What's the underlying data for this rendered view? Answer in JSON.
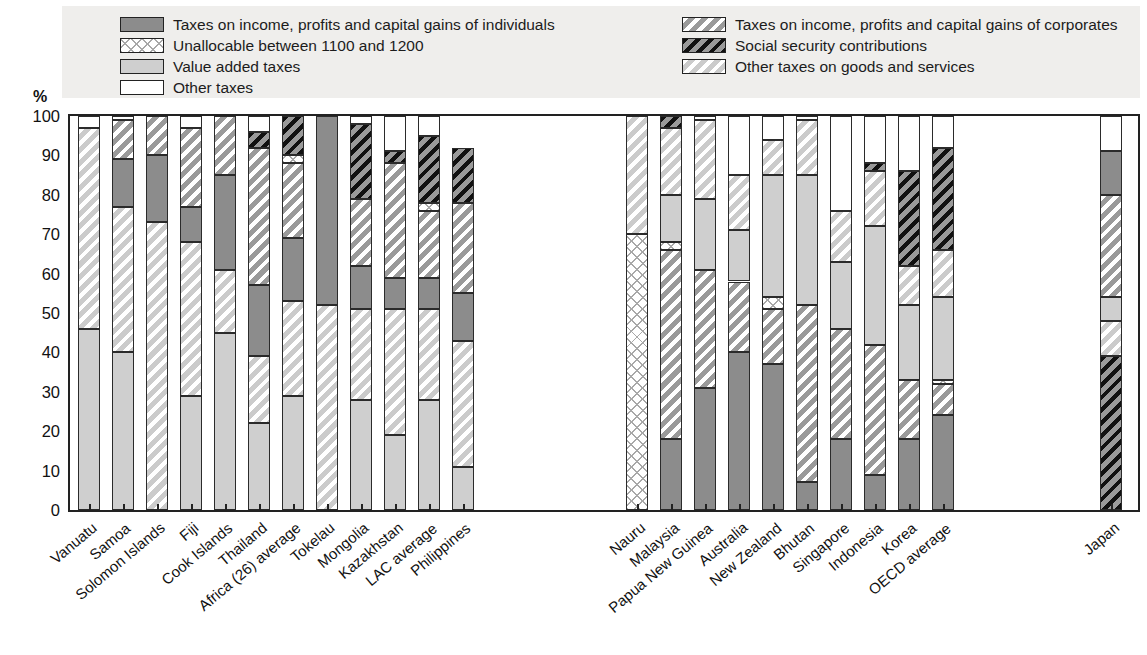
{
  "axis": {
    "y_unit": "%",
    "y_ticks": [
      0,
      10,
      20,
      30,
      40,
      50,
      60,
      70,
      80,
      90,
      100
    ],
    "y_label_0": "0",
    "y_label_10": "10",
    "y_label_20": "20",
    "y_label_30": "30",
    "y_label_40": "40",
    "y_label_50": "50",
    "y_label_60": "60",
    "y_label_70": "70",
    "y_label_80": "80",
    "y_label_90": "90",
    "y_label_100": "100"
  },
  "legend": {
    "left": [
      {
        "label": "Taxes on income, profits and capital gains of individuals",
        "key": "individuals",
        "fill": "f-ind"
      },
      {
        "label": "Unallocable between 1100 and 1200",
        "key": "unallocable",
        "fill": "f-unalloc"
      },
      {
        "label": "Value added taxes",
        "key": "vat",
        "fill": "f-vat"
      },
      {
        "label": "Other taxes",
        "key": "other",
        "fill": "f-other"
      }
    ],
    "right": [
      {
        "label": "Taxes on income, profits and capital gains of corporates",
        "key": "corporates",
        "fill": "f-corp"
      },
      {
        "label": "Social security contributions",
        "key": "social_security",
        "fill": "f-ssc"
      },
      {
        "label": "Other taxes on goods and services",
        "key": "other_goods_services",
        "fill": "f-othgs"
      }
    ]
  },
  "chart_data": {
    "type": "bar",
    "subtype": "stacked-100-percent",
    "title": "",
    "xlabel": "",
    "ylabel": "%",
    "ylim": [
      0,
      100
    ],
    "grid": false,
    "legend_position": "top",
    "series_order": [
      "vat",
      "other_goods_services",
      "unallocable",
      "individuals",
      "corporates",
      "social_security",
      "other"
    ],
    "series_names": {
      "individuals": "Taxes on income, profits and capital gains of individuals",
      "corporates": "Taxes on income, profits and capital gains of corporates",
      "unallocable": "Unallocable between 1100 and 1200",
      "social_security": "Social security contributions",
      "vat": "Value added taxes",
      "other_goods_services": "Other taxes on goods and services",
      "other": "Other taxes"
    },
    "categories": [
      "Vanuatu",
      "Samoa",
      "Solomon Islands",
      "Fiji",
      "Cook Islands",
      "Thailand",
      "Africa (26) average",
      "Tokelau",
      "Mongolia",
      "Kazakhstan",
      "LAC average",
      "Philippines",
      "",
      "Nauru",
      "Malaysia",
      "Papua New Guinea",
      "Australia",
      "New Zealand",
      "Bhutan",
      "Singapore",
      "Indonesia",
      "Korea",
      "OECD average",
      "",
      "Japan"
    ],
    "bars": [
      {
        "category": "Vanuatu",
        "segments": [
          {
            "key": "vat",
            "from": 0,
            "to": 46
          },
          {
            "key": "other_goods_services",
            "from": 46,
            "to": 97
          },
          {
            "key": "other",
            "from": 97,
            "to": 100
          }
        ]
      },
      {
        "category": "Samoa",
        "segments": [
          {
            "key": "vat",
            "from": 0,
            "to": 40
          },
          {
            "key": "other_goods_services",
            "from": 40,
            "to": 77
          },
          {
            "key": "individuals",
            "from": 77,
            "to": 89
          },
          {
            "key": "corporates",
            "from": 89,
            "to": 99
          },
          {
            "key": "other",
            "from": 99,
            "to": 100
          }
        ]
      },
      {
        "category": "Solomon Islands",
        "segments": [
          {
            "key": "other_goods_services",
            "from": 0,
            "to": 73
          },
          {
            "key": "individuals",
            "from": 73,
            "to": 90
          },
          {
            "key": "corporates",
            "from": 90,
            "to": 100
          }
        ]
      },
      {
        "category": "Fiji",
        "segments": [
          {
            "key": "vat",
            "from": 0,
            "to": 29
          },
          {
            "key": "other_goods_services",
            "from": 29,
            "to": 68
          },
          {
            "key": "individuals",
            "from": 68,
            "to": 77
          },
          {
            "key": "corporates",
            "from": 77,
            "to": 97
          },
          {
            "key": "other",
            "from": 97,
            "to": 100
          }
        ]
      },
      {
        "category": "Cook Islands",
        "segments": [
          {
            "key": "vat",
            "from": 0,
            "to": 45
          },
          {
            "key": "other_goods_services",
            "from": 45,
            "to": 61
          },
          {
            "key": "individuals",
            "from": 61,
            "to": 85
          },
          {
            "key": "corporates",
            "from": 85,
            "to": 100
          }
        ]
      },
      {
        "category": "Thailand",
        "segments": [
          {
            "key": "vat",
            "from": 0,
            "to": 22
          },
          {
            "key": "other_goods_services",
            "from": 22,
            "to": 39
          },
          {
            "key": "individuals",
            "from": 39,
            "to": 57
          },
          {
            "key": "corporates",
            "from": 57,
            "to": 92
          },
          {
            "key": "social_security",
            "from": 92,
            "to": 96
          },
          {
            "key": "other",
            "from": 96,
            "to": 100
          }
        ]
      },
      {
        "category": "Africa (26) average",
        "segments": [
          {
            "key": "vat",
            "from": 0,
            "to": 29
          },
          {
            "key": "other_goods_services",
            "from": 29,
            "to": 53
          },
          {
            "key": "individuals",
            "from": 53,
            "to": 69
          },
          {
            "key": "corporates",
            "from": 69,
            "to": 88
          },
          {
            "key": "unallocable",
            "from": 88,
            "to": 90
          },
          {
            "key": "social_security",
            "from": 90,
            "to": 100
          }
        ]
      },
      {
        "category": "Tokelau",
        "segments": [
          {
            "key": "other_goods_services",
            "from": 0,
            "to": 52
          },
          {
            "key": "individuals",
            "from": 52,
            "to": 100
          }
        ]
      },
      {
        "category": "Mongolia",
        "segments": [
          {
            "key": "vat",
            "from": 0,
            "to": 28
          },
          {
            "key": "other_goods_services",
            "from": 28,
            "to": 51
          },
          {
            "key": "individuals",
            "from": 51,
            "to": 62
          },
          {
            "key": "corporates",
            "from": 62,
            "to": 79
          },
          {
            "key": "social_security",
            "from": 79,
            "to": 98
          },
          {
            "key": "other",
            "from": 98,
            "to": 100
          }
        ]
      },
      {
        "category": "Kazakhstan",
        "segments": [
          {
            "key": "vat",
            "from": 0,
            "to": 19
          },
          {
            "key": "other_goods_services",
            "from": 19,
            "to": 51
          },
          {
            "key": "individuals",
            "from": 51,
            "to": 59
          },
          {
            "key": "corporates",
            "from": 59,
            "to": 88
          },
          {
            "key": "social_security",
            "from": 88,
            "to": 91
          },
          {
            "key": "other",
            "from": 91,
            "to": 100
          }
        ]
      },
      {
        "category": "LAC average",
        "segments": [
          {
            "key": "vat",
            "from": 0,
            "to": 28
          },
          {
            "key": "other_goods_services",
            "from": 28,
            "to": 51
          },
          {
            "key": "individuals",
            "from": 51,
            "to": 59
          },
          {
            "key": "corporates",
            "from": 59,
            "to": 76
          },
          {
            "key": "unallocable",
            "from": 76,
            "to": 78
          },
          {
            "key": "social_security",
            "from": 78,
            "to": 95
          },
          {
            "key": "other",
            "from": 95,
            "to": 100
          }
        ]
      },
      {
        "category": "Philippines",
        "segments": [
          {
            "key": "vat",
            "from": 0,
            "to": 11
          },
          {
            "key": "other_goods_services",
            "from": 11,
            "to": 43
          },
          {
            "key": "individuals",
            "from": 43,
            "to": 55
          },
          {
            "key": "corporates",
            "from": 55,
            "to": 78
          },
          {
            "key": "social_security",
            "from": 78,
            "to": 92
          }
        ]
      },
      {
        "category": "Nauru",
        "segments": [
          {
            "key": "unallocable",
            "from": 0,
            "to": 70
          },
          {
            "key": "other_goods_services",
            "from": 70,
            "to": 100
          }
        ]
      },
      {
        "category": "Malaysia",
        "segments": [
          {
            "key": "individuals",
            "from": 0,
            "to": 18
          },
          {
            "key": "corporates",
            "from": 18,
            "to": 66
          },
          {
            "key": "unallocable",
            "from": 66,
            "to": 68
          },
          {
            "key": "vat",
            "from": 68,
            "to": 80
          },
          {
            "key": "other_goods_services",
            "from": 80,
            "to": 97
          },
          {
            "key": "social_security",
            "from": 97,
            "to": 100
          }
        ]
      },
      {
        "category": "Papua New Guinea",
        "segments": [
          {
            "key": "individuals",
            "from": 0,
            "to": 31
          },
          {
            "key": "corporates",
            "from": 31,
            "to": 61
          },
          {
            "key": "vat",
            "from": 61,
            "to": 79
          },
          {
            "key": "other_goods_services",
            "from": 79,
            "to": 99
          },
          {
            "key": "other",
            "from": 99,
            "to": 100
          }
        ]
      },
      {
        "category": "Australia",
        "segments": [
          {
            "key": "individuals",
            "from": 0,
            "to": 40
          },
          {
            "key": "corporates",
            "from": 40,
            "to": 58
          },
          {
            "key": "vat",
            "from": 58,
            "to": 71
          },
          {
            "key": "other_goods_services",
            "from": 71,
            "to": 85
          },
          {
            "key": "other",
            "from": 85,
            "to": 100
          }
        ]
      },
      {
        "category": "New Zealand",
        "segments": [
          {
            "key": "individuals",
            "from": 0,
            "to": 37
          },
          {
            "key": "corporates",
            "from": 37,
            "to": 51
          },
          {
            "key": "unallocable",
            "from": 51,
            "to": 54
          },
          {
            "key": "vat",
            "from": 54,
            "to": 85
          },
          {
            "key": "other_goods_services",
            "from": 85,
            "to": 94
          },
          {
            "key": "other",
            "from": 94,
            "to": 100
          }
        ]
      },
      {
        "category": "Bhutan",
        "segments": [
          {
            "key": "individuals",
            "from": 0,
            "to": 7
          },
          {
            "key": "corporates",
            "from": 7,
            "to": 52
          },
          {
            "key": "vat",
            "from": 52,
            "to": 85
          },
          {
            "key": "other_goods_services",
            "from": 85,
            "to": 99
          },
          {
            "key": "other",
            "from": 99,
            "to": 100
          }
        ]
      },
      {
        "category": "Singapore",
        "segments": [
          {
            "key": "individuals",
            "from": 0,
            "to": 18
          },
          {
            "key": "corporates",
            "from": 18,
            "to": 46
          },
          {
            "key": "vat",
            "from": 46,
            "to": 63
          },
          {
            "key": "other_goods_services",
            "from": 63,
            "to": 76
          },
          {
            "key": "other",
            "from": 76,
            "to": 100
          }
        ]
      },
      {
        "category": "Indonesia",
        "segments": [
          {
            "key": "individuals",
            "from": 0,
            "to": 9
          },
          {
            "key": "corporates",
            "from": 9,
            "to": 42
          },
          {
            "key": "vat",
            "from": 42,
            "to": 72
          },
          {
            "key": "other_goods_services",
            "from": 72,
            "to": 86
          },
          {
            "key": "social_security",
            "from": 86,
            "to": 88
          },
          {
            "key": "other",
            "from": 88,
            "to": 100
          }
        ]
      },
      {
        "category": "Korea",
        "segments": [
          {
            "key": "individuals",
            "from": 0,
            "to": 18
          },
          {
            "key": "corporates",
            "from": 18,
            "to": 33
          },
          {
            "key": "vat",
            "from": 33,
            "to": 52
          },
          {
            "key": "other_goods_services",
            "from": 52,
            "to": 62
          },
          {
            "key": "social_security",
            "from": 62,
            "to": 86
          },
          {
            "key": "other",
            "from": 86,
            "to": 100
          }
        ]
      },
      {
        "category": "OECD average",
        "segments": [
          {
            "key": "individuals",
            "from": 0,
            "to": 24
          },
          {
            "key": "corporates",
            "from": 24,
            "to": 32
          },
          {
            "key": "unallocable",
            "from": 32,
            "to": 33
          },
          {
            "key": "vat",
            "from": 33,
            "to": 54
          },
          {
            "key": "other_goods_services",
            "from": 54,
            "to": 66
          },
          {
            "key": "social_security",
            "from": 66,
            "to": 92
          },
          {
            "key": "other",
            "from": 92,
            "to": 100
          }
        ]
      },
      {
        "category": "Japan",
        "segments": [
          {
            "key": "social_security",
            "from": 0,
            "to": 39
          },
          {
            "key": "other_goods_services",
            "from": 39,
            "to": 48
          },
          {
            "key": "vat",
            "from": 48,
            "to": 54
          },
          {
            "key": "corporates",
            "from": 54,
            "to": 80
          },
          {
            "key": "individuals",
            "from": 80,
            "to": 91
          },
          {
            "key": "other",
            "from": 91,
            "to": 100
          }
        ]
      }
    ]
  },
  "fill_class_map": {
    "individuals": "f-ind",
    "corporates": "f-corp",
    "unallocable": "f-unalloc",
    "social_security": "f-ssc",
    "vat": "f-vat",
    "other_goods_services": "f-othgs",
    "other": "f-other"
  },
  "bar_x_positions": [
    8,
    42,
    76,
    110,
    144,
    178,
    212,
    246,
    280,
    314,
    348,
    382,
    556,
    590,
    624,
    658,
    692,
    726,
    760,
    794,
    828,
    862,
    1030
  ]
}
